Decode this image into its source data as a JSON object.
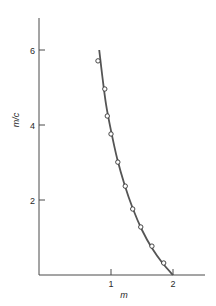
{
  "chart_data": {
    "type": "scatter",
    "title": "",
    "xlabel": "m",
    "ylabel": "m/c",
    "xlim": [
      -0.16,
      2.5
    ],
    "ylim": [
      0,
      6.8
    ],
    "x_ticks": [
      1,
      2
    ],
    "y_ticks": [
      2,
      4,
      6
    ],
    "grid": false,
    "legend": null,
    "series": [
      {
        "name": "observed",
        "kind": "points",
        "marker": "open-circle",
        "x": [
          0.79,
          0.9,
          0.94,
          1.0,
          1.11,
          1.23,
          1.35,
          1.48,
          1.66,
          1.85
        ],
        "y": [
          5.71,
          4.96,
          4.24,
          3.76,
          3.01,
          2.37,
          1.76,
          1.28,
          0.77,
          0.32
        ]
      },
      {
        "name": "fitted curve",
        "kind": "line",
        "x": [
          0.81,
          0.86,
          0.92,
          1.0,
          1.1,
          1.22,
          1.35,
          1.5,
          1.66,
          1.83,
          2.0
        ],
        "y": [
          6.0,
          5.3,
          4.55,
          3.85,
          3.1,
          2.4,
          1.78,
          1.2,
          0.72,
          0.32,
          0.0
        ]
      }
    ]
  },
  "axes": {
    "x_label": "m",
    "y_label": "m/c",
    "x_tick_labels": [
      "1",
      "2"
    ],
    "y_tick_labels": [
      "2",
      "4",
      "6"
    ]
  },
  "colors": {
    "axis": "#4a4a4a",
    "curve": "#555555",
    "marker": "#333333"
  }
}
